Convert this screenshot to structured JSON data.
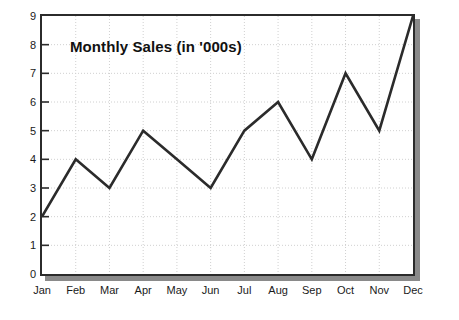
{
  "chart_data": {
    "type": "line",
    "title": "Monthly Sales (in '000s)",
    "xlabel": "",
    "ylabel": "",
    "categories": [
      "Jan",
      "Feb",
      "Mar",
      "Apr",
      "May",
      "Jun",
      "Jul",
      "Aug",
      "Sep",
      "Oct",
      "Nov",
      "Dec"
    ],
    "values": [
      2,
      4,
      3,
      5,
      4,
      3,
      5,
      6,
      4,
      7,
      5,
      9
    ],
    "series": [
      {
        "name": "Monthly Sales",
        "values": [
          2,
          4,
          3,
          5,
          4,
          3,
          5,
          6,
          4,
          7,
          5,
          9
        ]
      }
    ],
    "ylim": [
      0,
      9
    ],
    "yticks": [
      0,
      1,
      2,
      3,
      4,
      5,
      6,
      7,
      8,
      9
    ],
    "ytick_labels": [
      "0",
      "1",
      "2",
      "3",
      "4",
      "5",
      "6",
      "7",
      "8",
      "9"
    ],
    "grid": true,
    "grid_style": "dotted",
    "legend": false,
    "legend_position": "none",
    "markers": false
  },
  "colors": {
    "line": "#2b2b2b",
    "frame_border": "#2b2b2b",
    "frame_shadow": "#8a8a8a",
    "grid": "#d0d0d0",
    "plot_background": "#ffffff",
    "page_background": "#ffffff",
    "tick_label": "#1a1a1a",
    "title_text": "#111111"
  }
}
